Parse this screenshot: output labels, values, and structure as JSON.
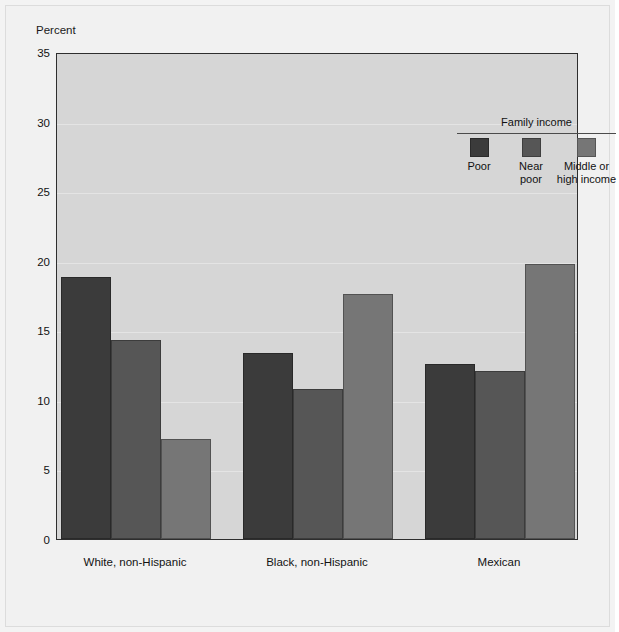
{
  "chart_data": {
    "type": "bar",
    "title": "",
    "ylabel": "Percent",
    "xlabel": "",
    "ylim": [
      0,
      35
    ],
    "yticks": [
      0,
      5,
      10,
      15,
      20,
      25,
      30,
      35
    ],
    "ytick_labels": [
      "0",
      "5",
      "10",
      "15",
      "20",
      "25",
      "30",
      "35"
    ],
    "grid": true,
    "legend_title": "Family income",
    "legend_position": "upper right inside plot",
    "categories": [
      "White, non-Hispanic",
      "Black, non-Hispanic",
      "Mexican"
    ],
    "series": [
      {
        "name": "Poor",
        "color": "#3b3b3b",
        "values": [
          18.8,
          13.4,
          12.6
        ]
      },
      {
        "name": "Near\npoor",
        "color": "#565656",
        "values": [
          14.3,
          10.8,
          12.1
        ]
      },
      {
        "name": "Middle or\nhigh income",
        "color": "#767676",
        "values": [
          7.2,
          17.6,
          19.8
        ]
      }
    ]
  },
  "axis": {
    "y_axis_label": "Percent",
    "tick_labels": [
      "35",
      "30",
      "25",
      "20",
      "15",
      "10",
      "5",
      "0"
    ]
  },
  "legend": {
    "title": "Family income",
    "items": [
      {
        "label": "Poor"
      },
      {
        "label": "Near\npoor"
      },
      {
        "label": "Middle or\nhigh income"
      }
    ]
  },
  "x_axis": {
    "group_labels": [
      "White, non-Hispanic",
      "Black, non-Hispanic",
      "Mexican"
    ]
  },
  "colors": {
    "series_poor": "#3b3b3b",
    "series_near_poor": "#565656",
    "series_middle_high": "#767676",
    "plot_background": "#d6d6d6",
    "figure_background": "#f1f1f1",
    "axis_line": "#2e2e2e"
  }
}
